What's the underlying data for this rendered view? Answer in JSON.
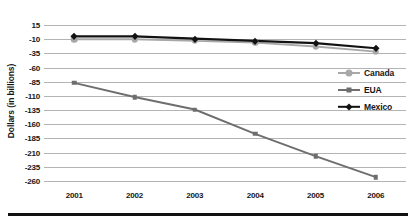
{
  "chart_data": {
    "type": "line",
    "title": "",
    "xlabel": "",
    "ylabel": "Dollars (in billions)",
    "categories": [
      "2001",
      "2002",
      "2003",
      "2004",
      "2005",
      "2006"
    ],
    "ylim": [
      -260,
      15
    ],
    "yticks": [
      15,
      -10,
      -35,
      -60,
      -85,
      -110,
      -135,
      -160,
      -185,
      -210,
      -235,
      -260
    ],
    "ytick_labels": [
      "15",
      "-10",
      "-35",
      "-60",
      "-85",
      "-110",
      "-135",
      "-160",
      "-185",
      "-210",
      "-235",
      "-260"
    ],
    "grid": true,
    "legend_position": "right",
    "series": [
      {
        "name": "Canada",
        "values": [
          -10,
          -10,
          -13,
          -16,
          -23,
          -32
        ],
        "color": "#a8a8a8",
        "marker": "circle"
      },
      {
        "name": "EUA",
        "values": [
          -87,
          -112,
          -134,
          -177,
          -216,
          -253
        ],
        "color": "#6e6e6e",
        "marker": "square"
      },
      {
        "name": "Mexico",
        "values": [
          -5,
          -5,
          -9,
          -13,
          -17,
          -26
        ],
        "color": "#121212",
        "marker": "diamond"
      }
    ]
  },
  "colors": {
    "gridline": "#b4b4b4",
    "axis_text": "#161616",
    "background": "#ffffff",
    "bottom_rule": "#111111"
  }
}
